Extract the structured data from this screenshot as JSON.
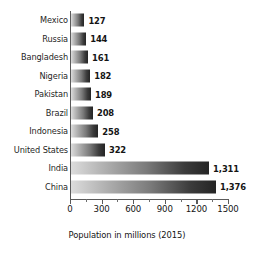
{
  "chart_data": {
    "type": "bar",
    "orientation": "horizontal",
    "title": "",
    "xlabel": "Population in millions (2015)",
    "ylabel": "",
    "xlim": [
      0,
      1500
    ],
    "xticks": [
      0,
      300,
      600,
      900,
      1200,
      1500
    ],
    "xtick_labels": [
      "0",
      "300",
      "600",
      "900",
      "1200",
      "1500"
    ],
    "minor_tick_step": 150,
    "grid": false,
    "legend": false,
    "categories": [
      "Mexico",
      "Russia",
      "Bangladesh",
      "Nigeria",
      "Pakistan",
      "Brazil",
      "Indonesia",
      "United States",
      "India",
      "China"
    ],
    "values": [
      127,
      144,
      161,
      182,
      189,
      208,
      258,
      322,
      1311,
      1376
    ],
    "value_labels": [
      "127",
      "144",
      "161",
      "182",
      "189",
      "208",
      "258",
      "322",
      "1,311",
      "1,376"
    ],
    "bars": [
      {
        "category": "Mexico",
        "value": 127,
        "label": "127"
      },
      {
        "category": "Russia",
        "value": 144,
        "label": "144"
      },
      {
        "category": "Bangladesh",
        "value": 161,
        "label": "161"
      },
      {
        "category": "Nigeria",
        "value": 182,
        "label": "182"
      },
      {
        "category": "Pakistan",
        "value": 189,
        "label": "189"
      },
      {
        "category": "Brazil",
        "value": 208,
        "label": "208"
      },
      {
        "category": "Indonesia",
        "value": 258,
        "label": "258"
      },
      {
        "category": "United States",
        "value": 322,
        "label": "322"
      },
      {
        "category": "India",
        "value": 1311,
        "label": "1,311"
      },
      {
        "category": "China",
        "value": 1376,
        "label": "1,376"
      }
    ],
    "colors": {
      "background": "#ffffff",
      "bar_gradient_start": "#dcdcdc",
      "bar_gradient_end": "#242424",
      "axis": "#5a5a5a",
      "text": "#141414"
    }
  }
}
